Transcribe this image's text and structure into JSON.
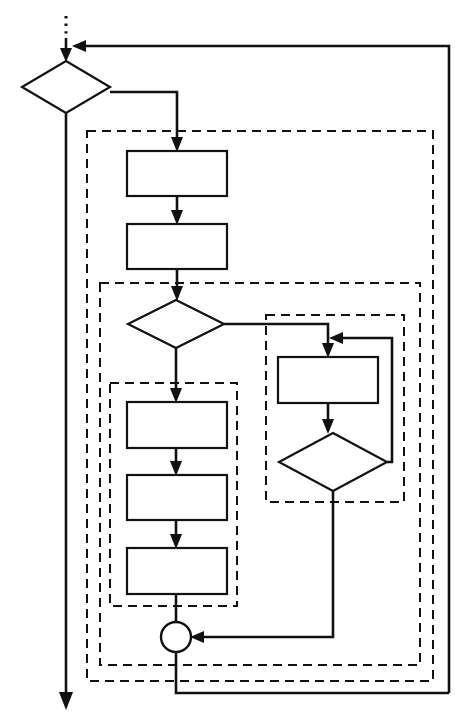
{
  "diagram": {
    "type": "flowchart",
    "background_color": "#ffffff",
    "stroke_color": "#111111",
    "canvas": {
      "width": 472,
      "height": 726
    },
    "entry": {
      "name": "entry-connector",
      "style": "dotted",
      "label": ""
    },
    "nodes": [
      {
        "id": "decision-1",
        "shape": "diamond",
        "label": "",
        "cx": 66,
        "cy": 87,
        "rx": 44,
        "ry": 26
      },
      {
        "id": "process-1",
        "shape": "rectangle",
        "label": "",
        "x": 127,
        "y": 151,
        "w": 100,
        "h": 45
      },
      {
        "id": "process-2",
        "shape": "rectangle",
        "label": "",
        "x": 127,
        "y": 224,
        "w": 100,
        "h": 45
      },
      {
        "id": "decision-2",
        "shape": "diamond",
        "label": "",
        "cx": 176,
        "cy": 324,
        "rx": 48,
        "ry": 24
      },
      {
        "id": "process-3",
        "shape": "rectangle",
        "label": "",
        "x": 127,
        "y": 402,
        "w": 100,
        "h": 46
      },
      {
        "id": "process-4",
        "shape": "rectangle",
        "label": "",
        "x": 127,
        "y": 475,
        "w": 100,
        "h": 45
      },
      {
        "id": "process-5",
        "shape": "rectangle",
        "label": "",
        "x": 127,
        "y": 548,
        "w": 100,
        "h": 46
      },
      {
        "id": "process-6",
        "shape": "rectangle",
        "label": "",
        "x": 278,
        "y": 357,
        "w": 100,
        "h": 46
      },
      {
        "id": "decision-3",
        "shape": "diamond",
        "label": "",
        "cx": 333,
        "cy": 462,
        "rx": 54,
        "ry": 29
      },
      {
        "id": "merge-node",
        "shape": "circle",
        "label": "",
        "cx": 176,
        "cy": 637,
        "r": 15
      }
    ],
    "groups": [
      {
        "id": "group-outer",
        "label": "",
        "x": 87,
        "y": 131,
        "w": 346,
        "h": 550
      },
      {
        "id": "group-middle",
        "label": "",
        "x": 100,
        "y": 283,
        "w": 320,
        "h": 382
      },
      {
        "id": "group-left-sequence",
        "label": "",
        "x": 110,
        "y": 383,
        "w": 127,
        "h": 223
      },
      {
        "id": "group-right-loop",
        "label": "",
        "x": 266,
        "y": 315,
        "w": 138,
        "h": 187
      }
    ],
    "edges": [
      {
        "id": "edge-entry-to-decision-1",
        "from": "entry",
        "to": "decision-1",
        "label": ""
      },
      {
        "id": "edge-decision-1-right-to-process-1",
        "from": "decision-1",
        "to": "process-1",
        "label": ""
      },
      {
        "id": "edge-decision-1-down-exit",
        "from": "decision-1",
        "to": "exit",
        "label": ""
      },
      {
        "id": "edge-process-1-to-process-2",
        "from": "process-1",
        "to": "process-2",
        "label": ""
      },
      {
        "id": "edge-process-2-to-decision-2",
        "from": "process-2",
        "to": "decision-2",
        "label": ""
      },
      {
        "id": "edge-decision-2-down-to-process-3",
        "from": "decision-2",
        "to": "process-3",
        "label": ""
      },
      {
        "id": "edge-decision-2-right-to-process-6",
        "from": "decision-2",
        "to": "process-6",
        "label": ""
      },
      {
        "id": "edge-process-3-to-process-4",
        "from": "process-3",
        "to": "process-4",
        "label": ""
      },
      {
        "id": "edge-process-4-to-process-5",
        "from": "process-4",
        "to": "process-5",
        "label": ""
      },
      {
        "id": "edge-process-5-to-merge-node",
        "from": "process-5",
        "to": "merge-node",
        "label": ""
      },
      {
        "id": "edge-process-6-to-decision-3",
        "from": "process-6",
        "to": "decision-3",
        "label": ""
      },
      {
        "id": "edge-decision-3-loopback-to-process-6",
        "from": "decision-3",
        "to": "process-6",
        "label": ""
      },
      {
        "id": "edge-decision-3-down-to-merge-node",
        "from": "decision-3",
        "to": "merge-node",
        "label": ""
      },
      {
        "id": "edge-merge-node-to-decision-1-feedback",
        "from": "merge-node",
        "to": "decision-1",
        "label": ""
      }
    ],
    "exit": {
      "name": "exit-connector",
      "style": "solid",
      "label": ""
    }
  }
}
